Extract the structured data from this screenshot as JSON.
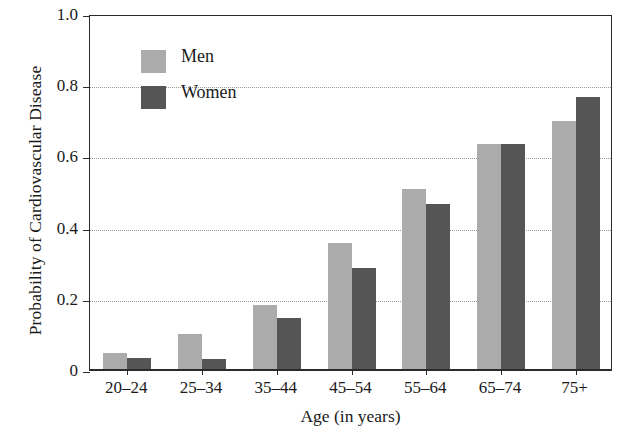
{
  "chart_data": {
    "type": "bar",
    "title": "",
    "subtitle": "",
    "xlabel": "Age (in years)",
    "ylabel": "Probability of Cardiovascular Disease",
    "categories": [
      "20–24",
      "25–34",
      "35–44",
      "45–54",
      "55–64",
      "65–74",
      "75+"
    ],
    "series": [
      {
        "name": "Men",
        "color": "#ababab",
        "values": [
          0.045,
          0.098,
          0.18,
          0.354,
          0.506,
          0.632,
          0.697
        ]
      },
      {
        "name": "Women",
        "color": "#555555",
        "values": [
          0.031,
          0.028,
          0.143,
          0.284,
          0.464,
          0.632,
          0.765
        ]
      }
    ],
    "ylim": [
      0,
      1.0
    ],
    "yticks": [
      0,
      0.2,
      0.4,
      0.6,
      0.8,
      1.0
    ],
    "ytick_labels": [
      "0",
      "0.2",
      "0.4",
      "0.6",
      "0.8",
      "1.0"
    ],
    "gridlines_at": [
      0.2,
      0.4,
      0.6,
      0.8
    ],
    "grid": true,
    "grid_style": "dotted-horizontal",
    "legend_position": "upper-left-inside",
    "legend": [
      {
        "label": "Men",
        "color": "#ababab"
      },
      {
        "label": "Women",
        "color": "#555555"
      }
    ],
    "axis_color": "#2b2b2b",
    "background": "#ffffff"
  }
}
